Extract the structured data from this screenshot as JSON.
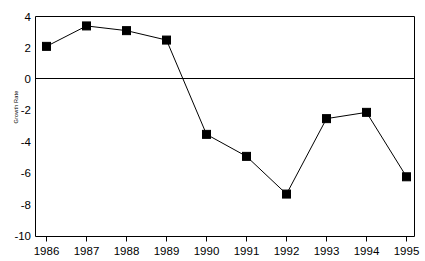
{
  "chart_data": {
    "type": "line",
    "title": "",
    "xlabel": "",
    "ylabel": "Growth Rate",
    "categories": [
      "1986",
      "1987",
      "1988",
      "1989",
      "1990",
      "1991",
      "1992",
      "1993",
      "1994",
      "1995"
    ],
    "values": [
      2.1,
      3.4,
      3.1,
      2.5,
      -3.5,
      -4.9,
      -7.3,
      -2.5,
      -2.1,
      -6.2
    ],
    "series": [
      {
        "name": "Growth Rate",
        "values": [
          2.1,
          3.4,
          3.1,
          2.5,
          -3.5,
          -4.9,
          -7.3,
          -2.5,
          -2.1,
          -6.2
        ]
      }
    ],
    "ylim": [
      -10,
      4
    ],
    "yticks": [
      4,
      2,
      0,
      -2,
      -4,
      -6,
      -8,
      -10
    ],
    "ytick_labels": [
      "4",
      "2",
      "0",
      "-2",
      "-4",
      "-6",
      "-8",
      "-10"
    ],
    "xtick_labels": [
      "1986",
      "1987",
      "1988",
      "1989",
      "1990",
      "1991",
      "1992",
      "1993",
      "1994",
      "1995"
    ],
    "grid": false,
    "zero_line": true,
    "legend": "none",
    "marker": "filled-square",
    "line_color": "#000000",
    "marker_color": "#000000",
    "background_color": "#ffffff"
  },
  "axis": {
    "y_label": "Growth Rate",
    "y_ticks": [
      "4",
      "2",
      "0",
      "-2",
      "-4",
      "-6",
      "-8",
      "-10"
    ],
    "x_ticks": [
      "1986",
      "1987",
      "1988",
      "1989",
      "1990",
      "1991",
      "1992",
      "1993",
      "1994",
      "1995"
    ]
  }
}
